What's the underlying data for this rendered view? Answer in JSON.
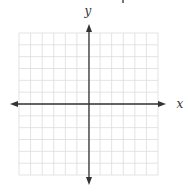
{
  "diagram": {
    "type": "coordinate-plane",
    "x_label": "x",
    "y_label": "y",
    "grid": {
      "cols": 12,
      "rows": 12,
      "left": 19,
      "top": 33,
      "right": 158,
      "bottom": 175,
      "color": "#dcdcdc"
    },
    "axes": {
      "origin_x": 89,
      "origin_y": 104,
      "x_min_tip": 10,
      "x_max_tip": 166,
      "y_min_tip": 24,
      "y_max_tip": 185,
      "color": "#333333"
    }
  }
}
